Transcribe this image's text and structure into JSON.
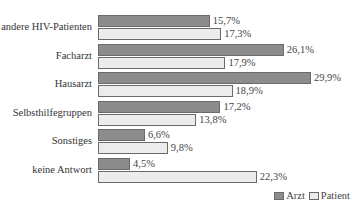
{
  "chart_data": {
    "type": "bar",
    "orientation": "horizontal",
    "title": "",
    "xlabel": "",
    "ylabel": "",
    "categories": [
      "andere HIV-Patienten",
      "Facharzt",
      "Hausarzt",
      "Selbsthilfegruppen",
      "Sonstiges",
      "keine Antwort"
    ],
    "series": [
      {
        "name": "Arzt",
        "values": [
          15.7,
          26.1,
          29.9,
          17.2,
          6.6,
          4.5
        ],
        "labels": [
          "15,7%",
          "26,1%",
          "29,9%",
          "17,2%",
          "6,6%",
          "4,5%"
        ],
        "color": "#8c8c8c"
      },
      {
        "name": "Patient",
        "values": [
          17.3,
          17.9,
          18.9,
          13.8,
          9.8,
          22.3
        ],
        "labels": [
          "17,3%",
          "17,9%",
          "18,9%",
          "13,8%",
          "9,8%",
          "22,3%"
        ],
        "color": "#ececec"
      }
    ],
    "grid": false,
    "legend_position": "bottom-right",
    "xlim": [
      0,
      30
    ]
  }
}
